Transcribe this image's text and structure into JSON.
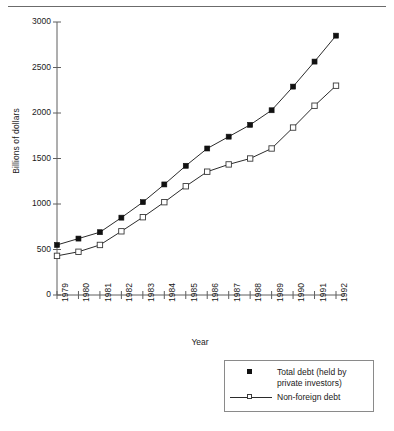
{
  "chart_data": {
    "type": "line",
    "title": "",
    "xlabel": "Year",
    "ylabel": "Billions of dollars",
    "categories": [
      "1979",
      "1980",
      "1981",
      "1982",
      "1983",
      "1984",
      "1985",
      "1986",
      "1987",
      "1988",
      "1989",
      "1990",
      "1991",
      "1992"
    ],
    "xtick_labels": [
      "1979",
      "1980",
      "1981",
      "1982",
      "1983",
      "1984",
      "1985",
      "1986",
      "1987",
      "1988",
      "1989",
      "1990",
      "1991",
      "1992"
    ],
    "ytick_labels": [
      "0",
      "500",
      "1000",
      "1500",
      "2000",
      "2500",
      "3000"
    ],
    "ytick_values": [
      0,
      500,
      1000,
      1500,
      2000,
      2500,
      3000
    ],
    "ylim": [
      0,
      3000
    ],
    "grid": false,
    "legend_position": "below-right",
    "series": [
      {
        "name": "Total debt (held by private investors)",
        "marker": "filled-square",
        "color": "#111111",
        "values": [
          550,
          620,
          690,
          850,
          1020,
          1215,
          1420,
          1610,
          1740,
          1870,
          2030,
          2290,
          2565,
          2850
        ]
      },
      {
        "name": "Non-foreign debt",
        "marker": "open-square",
        "color": "#333333",
        "values": [
          430,
          475,
          550,
          700,
          855,
          1020,
          1195,
          1355,
          1435,
          1500,
          1610,
          1840,
          2080,
          2300
        ]
      }
    ]
  },
  "legend": {
    "items": [
      {
        "label": "Total debt (held by private investors)",
        "marker": "filled-square"
      },
      {
        "label": "Non-foreign debt",
        "marker": "open-square-with-line"
      }
    ]
  },
  "axes": {
    "x_title": "Year",
    "y_title": "Billions of dollars"
  }
}
